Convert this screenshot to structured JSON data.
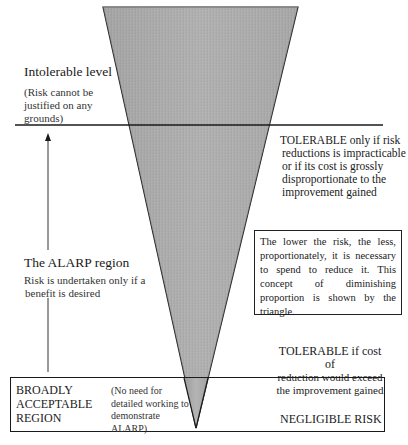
{
  "diagram": {
    "type": "ALARP triangle",
    "intolerable": {
      "title": "Intolerable level",
      "desc_lines": [
        "(Risk cannot be",
        "justified on any",
        "grounds)"
      ]
    },
    "tolerable_top": {
      "lines": [
        "TOLERABLE only if risk",
        "reductions is impracticable",
        "or if its cost is grossly",
        "disproportionate to the",
        "improvement gained"
      ]
    },
    "alarp": {
      "title": "The ALARP region",
      "desc_lines": [
        "Risk is undertaken only if a",
        "benefit is desired"
      ]
    },
    "note": {
      "text": "The lower the risk, the less, proportionately, it is necessary to spend to reduce it.  This concept of diminishing proportion is shown by the triangle."
    },
    "tolerable_bottom": {
      "lines": [
        "TOLERABLE if cost of",
        "reduction would exceed",
        "the improvement gained"
      ]
    },
    "broadly_acceptable": {
      "title_lines": [
        "BROADLY",
        "ACCEPTABLE",
        "REGION"
      ],
      "desc_lines": [
        "(No need for",
        "detailed working to",
        "demonstrate",
        "ALARP)"
      ]
    },
    "negligible": {
      "label": "NEGLIGIBLE RISK"
    },
    "colors": {
      "triangle_fill": "#a9a9a9",
      "line": "#1a1a1a"
    }
  }
}
